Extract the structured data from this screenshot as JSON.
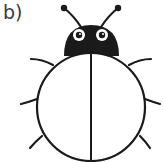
{
  "label": "b)",
  "figure": {
    "stroke_color": "#1a1a1a",
    "fill_body": "#ffffff",
    "fill_head": "#1a1a1a"
  }
}
